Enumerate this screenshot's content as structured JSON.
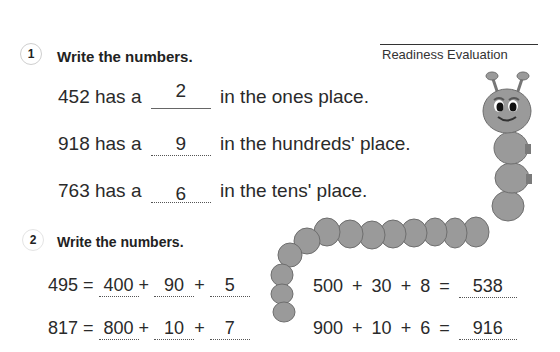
{
  "header": {
    "title": "Readiness Evaluation"
  },
  "section1": {
    "number": "1",
    "heading": "Write the numbers.",
    "items": [
      {
        "prefix": "452 has a",
        "answer": "2",
        "suffix": "in the ones place."
      },
      {
        "prefix": "918 has a",
        "answer": "9",
        "suffix": "in the hundreds' place."
      },
      {
        "prefix": "763 has a",
        "answer": "6",
        "suffix": "in the tens' place."
      }
    ]
  },
  "section2": {
    "number": "2",
    "heading": "Write the numbers.",
    "expanded": [
      {
        "number": "495",
        "eq": "=",
        "parts": [
          "400",
          "90",
          "5"
        ],
        "plus": "+"
      },
      {
        "number": "817",
        "eq": "=",
        "parts": [
          "800",
          "10",
          "7"
        ],
        "plus": "+"
      }
    ],
    "standard": [
      {
        "addends": [
          "500",
          "30",
          "8"
        ],
        "plus": "+",
        "eq": "=",
        "answer": "538"
      },
      {
        "addends": [
          "900",
          "10",
          "6"
        ],
        "plus": "+",
        "eq": "=",
        "answer": "916"
      }
    ]
  },
  "illustration": {
    "name": "caterpillar"
  }
}
